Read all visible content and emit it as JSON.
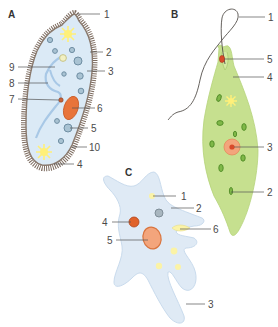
{
  "figure": {
    "panels": [
      {
        "id": "A",
        "letter": "A",
        "organism_hint": "paramecium",
        "labels": [
          "1",
          "2",
          "3",
          "4",
          "5",
          "6",
          "7",
          "8",
          "9",
          "10"
        ]
      },
      {
        "id": "B",
        "letter": "B",
        "organism_hint": "euglena",
        "labels": [
          "1",
          "2",
          "3",
          "4",
          "5"
        ]
      },
      {
        "id": "C",
        "letter": "C",
        "organism_hint": "amoeba",
        "labels": [
          "1",
          "2",
          "3",
          "4",
          "5",
          "6"
        ]
      }
    ]
  },
  "colors": {
    "paramecium_body": "#dbeaf6",
    "paramecium_cilia": "#8a7a6e",
    "euglena_body": "#c6e08f",
    "euglena_chloroplast": "#6ea83c",
    "amoeba_body": "#dfeaf5",
    "nucleus_orange": "#e8743a",
    "nucleus_ring": "#f3a57c",
    "vacuole_yellow": "#fbf3a6",
    "contractile_star": "#fff07a",
    "leader_line": "#555555",
    "label_text": "#4a4a4a"
  }
}
